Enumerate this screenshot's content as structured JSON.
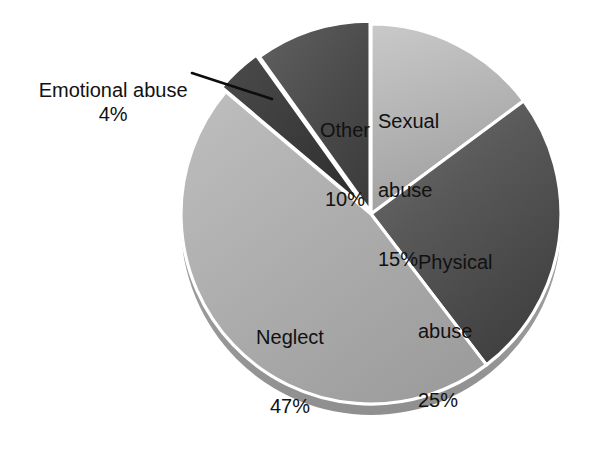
{
  "chart_data": {
    "type": "pie",
    "title": "",
    "subtitle": "",
    "xlabel": "",
    "ylabel": "",
    "legend_position": "none",
    "grid": false,
    "unit": "%",
    "total": 101,
    "start_angle_deg": 0,
    "direction": "clockwise",
    "categories": [
      "Sexual abuse",
      "Physical abuse",
      "Neglect",
      "Emotional abuse",
      "Other"
    ],
    "values": [
      15,
      25,
      47,
      4,
      10
    ],
    "slices": [
      {
        "name": "Sexual abuse",
        "value": 15,
        "value_label": "15%",
        "label_line1": "Sexual",
        "label_line2": "abuse",
        "label_placement": "inside",
        "color": "#b4b4b4",
        "color_light": "#cfcfcf",
        "color_dark": "#9a9a9a"
      },
      {
        "name": "Physical abuse",
        "value": 25,
        "value_label": "25%",
        "label_line1": "Physical",
        "label_line2": "abuse",
        "label_placement": "inside",
        "color": "#585858",
        "color_light": "#7a7a7a",
        "color_dark": "#3f3f3f"
      },
      {
        "name": "Neglect",
        "value": 47,
        "value_label": "47%",
        "label_line1": "Neglect",
        "label_line2": "",
        "label_placement": "inside",
        "color": "#a9a9a9",
        "color_light": "#bdbdbd",
        "color_dark": "#959595"
      },
      {
        "name": "Emotional abuse",
        "value": 4,
        "value_label": "4%",
        "label_line1": "Emotional abuse",
        "label_line2": "",
        "label_placement": "callout",
        "color": "#3c3c3c",
        "color_light": "#565656",
        "color_dark": "#2b2b2b"
      },
      {
        "name": "Other",
        "value": 10,
        "value_label": "10%",
        "label_line1": "Other",
        "label_line2": "",
        "label_placement": "inside",
        "color": "#4d4d4d",
        "color_light": "#6a6a6a",
        "color_dark": "#3a3a3a"
      }
    ],
    "style": {
      "background": "#ffffff",
      "separator_color": "#ffffff",
      "shadow_color": "#9d9d9d",
      "text_color": "#111111",
      "callout_line_color": "#0d0d0d"
    }
  }
}
